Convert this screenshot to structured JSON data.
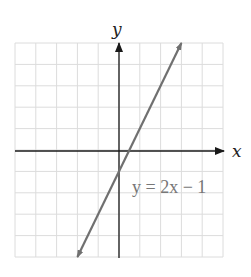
{
  "chart_data": {
    "type": "line",
    "title": "",
    "xlabel": "x",
    "ylabel": "y",
    "xlim": [
      -5,
      5
    ],
    "ylim": [
      -5,
      5
    ],
    "grid": true,
    "grid_step": 1,
    "tick_labels_shown": false,
    "series": [
      {
        "name": "y = 2x − 1",
        "equation": "y = 2x − 1",
        "slope": 2,
        "intercept": -1,
        "x": [
          -2,
          0,
          0.5,
          3
        ],
        "y": [
          -5,
          -1,
          0,
          5
        ],
        "arrows_both_ends": true
      }
    ],
    "annotations": [
      {
        "text": "y = 2x − 1",
        "x": 0.6,
        "y": -2
      }
    ]
  },
  "labels": {
    "x_axis": "x",
    "y_axis": "y",
    "equation": "y = 2x − 1"
  },
  "colors": {
    "grid": "#dcdcdc",
    "axis": "#1a1a1a",
    "line": "#707070",
    "equation_text": "#777777"
  }
}
